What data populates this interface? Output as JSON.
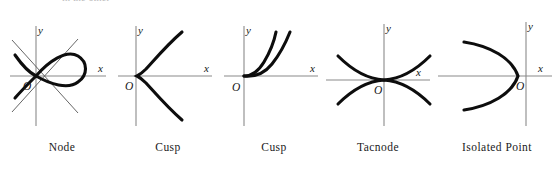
{
  "figure": {
    "top_cut_text": "in the other",
    "background_color": "#ffffff",
    "curve_color": "#0d0d0d",
    "axis_color": "#8a8a8a",
    "tangent_color": "#555555",
    "axis_labels": {
      "x": "x",
      "y": "y",
      "origin": "O"
    },
    "panels": [
      {
        "id": "node",
        "caption": "Node",
        "x_label": "x",
        "y_label": "y",
        "origin_label": "O",
        "description": "Looped curve crossing itself at the origin with two distinct tangent lines"
      },
      {
        "id": "cusp-1",
        "caption": "Cusp",
        "x_label": "x",
        "y_label": "y",
        "origin_label": "O",
        "description": "Semicubical parabola cusp opening to the right, symmetric about the x-axis"
      },
      {
        "id": "cusp-2",
        "caption": "Cusp",
        "x_label": "x",
        "y_label": "y",
        "origin_label": "O",
        "description": "Ramphoid cusp, two branches leaving the origin upward to the right"
      },
      {
        "id": "tacnode",
        "caption": "Tacnode",
        "x_label": "x",
        "y_label": "y",
        "origin_label": "O",
        "description": "Two curves tangent to one another at the origin, one opening up and one opening down"
      },
      {
        "id": "isolated-point",
        "caption": "Isolated Point",
        "x_label": "x",
        "y_label": "y",
        "origin_label": "O",
        "description": "Leftward opening parabola with the y-axis drawn to the right of the vertex"
      }
    ]
  }
}
